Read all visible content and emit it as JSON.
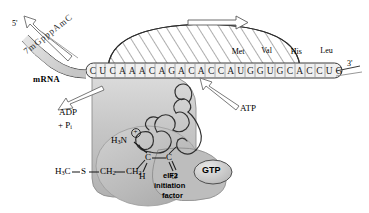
{
  "figure": {
    "background_color": "#ffffff",
    "ink_color": "#1d1d1d",
    "body_fill": "#bdbdbd",
    "body_fill_light": "#d2d2d2",
    "hatch_fill": "#ffffff"
  },
  "mrna": {
    "label": "mRNA",
    "five_prime": "5'",
    "three_prime": "3'",
    "cap_letters": [
      "7",
      "m",
      "G",
      "p",
      "p",
      "p",
      "A",
      "m",
      "C"
    ],
    "cap_text": "7mGpppAmC",
    "sequence": [
      "C",
      "U",
      "C",
      "A",
      "A",
      "A",
      "C",
      "A",
      "G",
      "A",
      "C",
      "A",
      "C",
      "C",
      "A",
      "U",
      "G",
      "G",
      "U",
      "G",
      "C",
      "A",
      "C",
      "C",
      "U",
      "G"
    ],
    "sequence_text": "CUCAAACAGACACCAUGGUGCACCUG"
  },
  "codon_labels": [
    {
      "name": "Met",
      "codon": "AUG",
      "index": 14
    },
    {
      "name": "Val",
      "codon": "GUG",
      "index": 17
    },
    {
      "name": "His",
      "codon": "CAC",
      "index": 20
    },
    {
      "name": "Leu",
      "codon": "CUG",
      "index": 23
    }
  ],
  "energetics": {
    "input": "ATP",
    "output_line1": "ADP",
    "output_line2": "+ P",
    "output_line2_sub": "i"
  },
  "factor": {
    "name": "eIF2",
    "line2": "initiation",
    "line3": "factor",
    "cofactor": "GTP"
  },
  "methionine": {
    "terminal_methyl": "H",
    "terminal_methyl_sub": "3",
    "terminal_methyl_tail": "C",
    "sulfur": "S",
    "ch2_a": "CH",
    "ch2_a_sub": "2",
    "ch2_b": "CH",
    "ch2_b_sub": "2",
    "alpha_carbon": "C",
    "carbonyl_carbon": "C",
    "alpha_hydrogen": "H",
    "carbonyl_oxygen": "O",
    "amino_group": "H",
    "amino_group_sub": "3",
    "amino_group_n": "N",
    "amino_charge": "+"
  },
  "arrows": {
    "scanning_direction": "right",
    "cap_recognition": "up-left"
  }
}
